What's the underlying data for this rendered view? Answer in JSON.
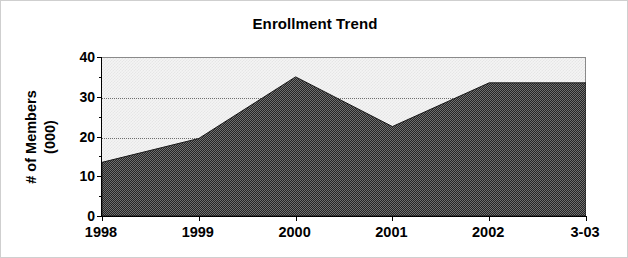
{
  "chart_data": {
    "type": "area",
    "title": "Enrollment Trend",
    "xlabel": "",
    "ylabel": "# of Members (000)",
    "ylabel_lines": [
      "# of Members",
      "(000)"
    ],
    "categories": [
      "1998",
      "1999",
      "2000",
      "2001",
      "2002",
      "3-03"
    ],
    "values": [
      13.5,
      19.5,
      35,
      22.5,
      33.5,
      33.5
    ],
    "series": [
      {
        "name": "Enrollment",
        "values": [
          13.5,
          19.5,
          35,
          22.5,
          33.5,
          33.5
        ]
      }
    ],
    "ylim": [
      0,
      40
    ],
    "yticks": [
      0,
      10,
      20,
      30,
      40
    ],
    "ytick_labels": [
      "0",
      "10",
      "20",
      "30",
      "40"
    ],
    "y_minor_ticks": [
      5,
      15,
      25,
      35
    ],
    "grid": "horizontal-dotted",
    "legend": "none",
    "colors": {
      "area_fill": "#4d4d4d",
      "plot_background": "#f1f1f1",
      "axis": "#000000",
      "gridline": "#6d6d6d",
      "text": "#000000",
      "frame_border": "#cfcfcf"
    }
  }
}
